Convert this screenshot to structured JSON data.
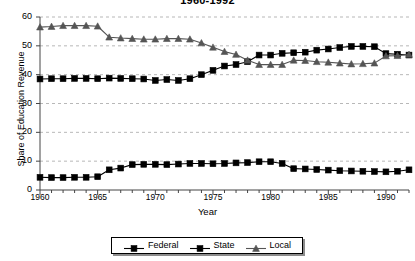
{
  "chart_data": {
    "type": "line",
    "title": "1960-1992",
    "xlabel": "Year",
    "ylabel": "Share of Education Revenue",
    "xlim": [
      1960,
      1992
    ],
    "ylim": [
      0,
      60
    ],
    "yticks": [
      0,
      10,
      20,
      30,
      40,
      50,
      60
    ],
    "xticks": [
      1960,
      1965,
      1970,
      1975,
      1980,
      1985,
      1990
    ],
    "xtick_minor_step": 1,
    "grid": "horizontal-dashed",
    "legend_position": "bottom-center",
    "x": [
      1960,
      1961,
      1962,
      1963,
      1964,
      1965,
      1966,
      1967,
      1968,
      1969,
      1970,
      1971,
      1972,
      1973,
      1974,
      1975,
      1976,
      1977,
      1978,
      1979,
      1980,
      1981,
      1982,
      1983,
      1984,
      1985,
      1986,
      1987,
      1988,
      1989,
      1990,
      1991,
      1992
    ],
    "series": [
      {
        "name": "Federal",
        "marker": "square",
        "color": "#000000",
        "values": [
          4.4,
          4.3,
          4.3,
          4.4,
          4.4,
          4.6,
          7.0,
          7.6,
          8.8,
          8.9,
          8.9,
          8.8,
          9.0,
          9.2,
          9.2,
          9.1,
          9.2,
          9.4,
          9.5,
          9.8,
          9.8,
          9.2,
          7.4,
          7.3,
          7.1,
          6.9,
          6.7,
          6.6,
          6.5,
          6.4,
          6.3,
          6.5,
          7.0
        ]
      },
      {
        "name": "State",
        "marker": "square",
        "color": "#000000",
        "values": [
          38.5,
          38.6,
          38.6,
          38.7,
          38.7,
          38.6,
          38.8,
          38.7,
          38.6,
          38.5,
          38.0,
          38.3,
          38.0,
          38.6,
          40.0,
          41.5,
          43.0,
          43.5,
          44.5,
          46.8,
          46.8,
          47.4,
          47.6,
          47.8,
          48.5,
          48.9,
          49.4,
          49.8,
          49.8,
          49.7,
          47.3,
          47.1,
          46.8
        ]
      },
      {
        "name": "Local",
        "marker": "triangle",
        "color": "#555555",
        "values": [
          56.5,
          56.7,
          57.0,
          57.0,
          57.0,
          56.8,
          53.0,
          52.7,
          52.5,
          52.3,
          52.3,
          52.5,
          52.5,
          52.3,
          51.0,
          49.5,
          48.0,
          47.0,
          45.0,
          43.5,
          43.5,
          43.5,
          45.0,
          44.9,
          44.5,
          44.3,
          44.0,
          43.7,
          43.8,
          44.0,
          46.5,
          46.6,
          47.0
        ]
      }
    ]
  }
}
